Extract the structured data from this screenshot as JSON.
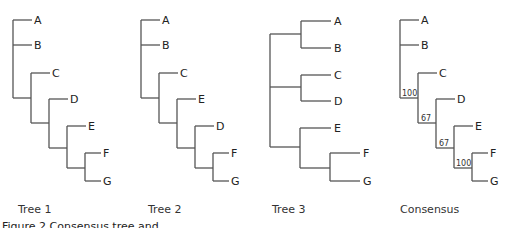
{
  "figure_caption": "Figure 2 Consensus tree and",
  "trees": [
    {
      "caption": "Tree 1",
      "caption_x": 18,
      "lines": [
        [
          13,
          20,
          13,
          98
        ],
        [
          13,
          20,
          32,
          20
        ],
        [
          13,
          45,
          32,
          45
        ],
        [
          13,
          98,
          31,
          98
        ],
        [
          31,
          73,
          31,
          123
        ],
        [
          31,
          73,
          50,
          73
        ],
        [
          31,
          123,
          49,
          123
        ],
        [
          49,
          99,
          49,
          148
        ],
        [
          49,
          99,
          68,
          99
        ],
        [
          49,
          148,
          67,
          148
        ],
        [
          67,
          126,
          67,
          168
        ],
        [
          67,
          126,
          86,
          126
        ],
        [
          67,
          168,
          85,
          168
        ],
        [
          85,
          153,
          85,
          181
        ],
        [
          85,
          153,
          101,
          153
        ],
        [
          85,
          181,
          101,
          181
        ]
      ],
      "leaves": [
        {
          "label": "A",
          "x": 34,
          "y": 24
        },
        {
          "label": "B",
          "x": 34,
          "y": 49
        },
        {
          "label": "C",
          "x": 52,
          "y": 77
        },
        {
          "label": "D",
          "x": 70,
          "y": 103
        },
        {
          "label": "E",
          "x": 88,
          "y": 130
        },
        {
          "label": "F",
          "x": 103,
          "y": 157
        },
        {
          "label": "G",
          "x": 103,
          "y": 185
        }
      ],
      "support": []
    },
    {
      "caption": "Tree 2",
      "caption_x": 148,
      "lines": [
        [
          141,
          20,
          141,
          98
        ],
        [
          141,
          20,
          160,
          20
        ],
        [
          141,
          45,
          160,
          45
        ],
        [
          141,
          98,
          159,
          98
        ],
        [
          159,
          73,
          159,
          123
        ],
        [
          159,
          73,
          178,
          73
        ],
        [
          159,
          123,
          177,
          123
        ],
        [
          177,
          99,
          177,
          148
        ],
        [
          177,
          99,
          196,
          99
        ],
        [
          177,
          148,
          195,
          148
        ],
        [
          195,
          126,
          195,
          168
        ],
        [
          195,
          126,
          214,
          126
        ],
        [
          195,
          168,
          213,
          168
        ],
        [
          213,
          153,
          213,
          181
        ],
        [
          213,
          153,
          229,
          153
        ],
        [
          213,
          181,
          229,
          181
        ]
      ],
      "leaves": [
        {
          "label": "A",
          "x": 162,
          "y": 24
        },
        {
          "label": "B",
          "x": 162,
          "y": 49
        },
        {
          "label": "C",
          "x": 180,
          "y": 77
        },
        {
          "label": "E",
          "x": 198,
          "y": 103
        },
        {
          "label": "D",
          "x": 216,
          "y": 130
        },
        {
          "label": "F",
          "x": 231,
          "y": 157
        },
        {
          "label": "G",
          "x": 231,
          "y": 185
        }
      ],
      "support": []
    },
    {
      "caption": "Tree 3",
      "caption_x": 272,
      "lines": [
        [
          270,
          34,
          270,
          147
        ],
        [
          270,
          34,
          301,
          34
        ],
        [
          301,
          21,
          301,
          48
        ],
        [
          301,
          21,
          331,
          21
        ],
        [
          301,
          48,
          331,
          48
        ],
        [
          270,
          87,
          301,
          87
        ],
        [
          301,
          75,
          301,
          101
        ],
        [
          301,
          75,
          331,
          75
        ],
        [
          301,
          101,
          331,
          101
        ],
        [
          270,
          147,
          300,
          147
        ],
        [
          300,
          128,
          300,
          168
        ],
        [
          300,
          128,
          331,
          128
        ],
        [
          300,
          168,
          330,
          168
        ],
        [
          330,
          153,
          330,
          181
        ],
        [
          330,
          153,
          360,
          153
        ],
        [
          330,
          181,
          360,
          181
        ]
      ],
      "leaves": [
        {
          "label": "A",
          "x": 334,
          "y": 25
        },
        {
          "label": "B",
          "x": 334,
          "y": 52
        },
        {
          "label": "C",
          "x": 334,
          "y": 79
        },
        {
          "label": "D",
          "x": 334,
          "y": 105
        },
        {
          "label": "E",
          "x": 334,
          "y": 132
        },
        {
          "label": "F",
          "x": 363,
          "y": 157
        },
        {
          "label": "G",
          "x": 363,
          "y": 185
        }
      ],
      "support": []
    },
    {
      "caption": "Consensus",
      "caption_x": 400,
      "lines": [
        [
          400,
          20,
          400,
          98
        ],
        [
          400,
          20,
          419,
          20
        ],
        [
          400,
          45,
          419,
          45
        ],
        [
          400,
          98,
          418,
          98
        ],
        [
          418,
          73,
          418,
          123
        ],
        [
          418,
          73,
          437,
          73
        ],
        [
          418,
          123,
          436,
          123
        ],
        [
          436,
          99,
          436,
          148
        ],
        [
          436,
          99,
          455,
          99
        ],
        [
          436,
          148,
          454,
          148
        ],
        [
          454,
          126,
          454,
          168
        ],
        [
          454,
          126,
          473,
          126
        ],
        [
          454,
          168,
          472,
          168
        ],
        [
          472,
          153,
          472,
          181
        ],
        [
          472,
          153,
          488,
          153
        ],
        [
          472,
          181,
          488,
          181
        ]
      ],
      "leaves": [
        {
          "label": "A",
          "x": 421,
          "y": 24
        },
        {
          "label": "B",
          "x": 421,
          "y": 49
        },
        {
          "label": "C",
          "x": 439,
          "y": 77
        },
        {
          "label": "D",
          "x": 457,
          "y": 103
        },
        {
          "label": "E",
          "x": 475,
          "y": 130
        },
        {
          "label": "F",
          "x": 490,
          "y": 157
        },
        {
          "label": "G",
          "x": 490,
          "y": 185
        }
      ],
      "support": [
        {
          "value": "100",
          "x": 402,
          "y": 96
        },
        {
          "value": "67",
          "x": 421,
          "y": 121
        },
        {
          "value": "67",
          "x": 439,
          "y": 146
        },
        {
          "value": "100",
          "x": 456,
          "y": 166
        }
      ]
    }
  ]
}
